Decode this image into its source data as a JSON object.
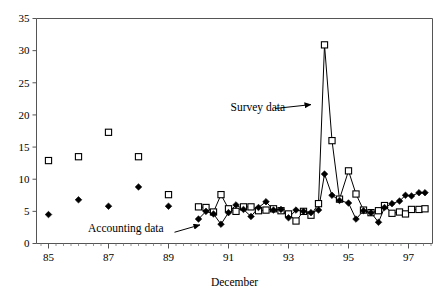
{
  "chart_data": {
    "type": "line",
    "title": "",
    "subtitle": "",
    "xlabel": "December",
    "ylabel": "",
    "xlim": [
      1984.6,
      1997.8
    ],
    "ylim": [
      0,
      35
    ],
    "grid": false,
    "legend_position": "none",
    "x_tick_labels": [
      "85",
      "87",
      "89",
      "91",
      "93",
      "95",
      "97"
    ],
    "x_tick_values": [
      1985,
      1987,
      1989,
      1991,
      1993,
      1995,
      1997
    ],
    "x_minor_tick_step": 0.25,
    "y_tick_labels": [
      "0",
      "5",
      "10",
      "15",
      "20",
      "25",
      "30",
      "35"
    ],
    "y_tick_values": [
      0,
      5,
      10,
      15,
      20,
      25,
      30,
      35
    ],
    "annotations": [
      {
        "name": "survey-data-annotation",
        "text": "Survey data",
        "text_x": 0.49,
        "text_y": 20.6,
        "arrow_from_x": 1992.55,
        "arrow_from_y": 21.0,
        "arrow_to_x": 1993.75,
        "arrow_to_y": 21.6
      },
      {
        "name": "accounting-data-annotation",
        "text": "Accounting data",
        "text_x": 0.13,
        "text_y": 1.85,
        "arrow_from_x": 1989.2,
        "arrow_from_y": 1.75,
        "arrow_to_x": 1990.05,
        "arrow_to_y": 2.9
      }
    ],
    "series": [
      {
        "name": "Survey data",
        "marker": "open-square",
        "color": "#000000",
        "connected_from_x": 1990.0,
        "points": [
          {
            "x": 1985.0,
            "y": 12.9
          },
          {
            "x": 1986.0,
            "y": 13.5
          },
          {
            "x": 1987.0,
            "y": 17.3
          },
          {
            "x": 1988.0,
            "y": 13.5
          },
          {
            "x": 1989.0,
            "y": 7.6
          },
          {
            "x": 1990.0,
            "y": 5.7
          },
          {
            "x": 1990.25,
            "y": 5.6
          },
          {
            "x": 1990.5,
            "y": 4.9
          },
          {
            "x": 1990.75,
            "y": 7.6
          },
          {
            "x": 1991.0,
            "y": 5.4
          },
          {
            "x": 1991.25,
            "y": 5.0
          },
          {
            "x": 1991.5,
            "y": 5.7
          },
          {
            "x": 1991.75,
            "y": 5.7
          },
          {
            "x": 1992.0,
            "y": 5.1
          },
          {
            "x": 1992.25,
            "y": 5.2
          },
          {
            "x": 1992.5,
            "y": 5.4
          },
          {
            "x": 1992.75,
            "y": 5.1
          },
          {
            "x": 1993.0,
            "y": 4.6
          },
          {
            "x": 1993.25,
            "y": 3.5
          },
          {
            "x": 1993.5,
            "y": 5.0
          },
          {
            "x": 1993.75,
            "y": 4.4
          },
          {
            "x": 1994.0,
            "y": 6.2
          },
          {
            "x": 1994.2,
            "y": 30.9
          },
          {
            "x": 1994.45,
            "y": 16.0
          },
          {
            "x": 1994.7,
            "y": 6.9
          },
          {
            "x": 1995.0,
            "y": 11.3
          },
          {
            "x": 1995.25,
            "y": 7.7
          },
          {
            "x": 1995.5,
            "y": 5.2
          },
          {
            "x": 1995.75,
            "y": 4.8
          },
          {
            "x": 1996.0,
            "y": 5.1
          },
          {
            "x": 1996.2,
            "y": 5.9
          },
          {
            "x": 1996.45,
            "y": 4.7
          },
          {
            "x": 1996.7,
            "y": 4.9
          },
          {
            "x": 1996.9,
            "y": 4.6
          },
          {
            "x": 1997.1,
            "y": 5.3
          },
          {
            "x": 1997.35,
            "y": 5.3
          },
          {
            "x": 1997.55,
            "y": 5.4
          }
        ]
      },
      {
        "name": "Accounting data",
        "marker": "filled-diamond",
        "color": "#000000",
        "connected_from_x": 1990.0,
        "points": [
          {
            "x": 1985.0,
            "y": 4.5
          },
          {
            "x": 1986.0,
            "y": 6.8
          },
          {
            "x": 1987.0,
            "y": 5.8
          },
          {
            "x": 1988.0,
            "y": 8.8
          },
          {
            "x": 1989.0,
            "y": 5.8
          },
          {
            "x": 1990.0,
            "y": 3.8
          },
          {
            "x": 1990.25,
            "y": 5.0
          },
          {
            "x": 1990.5,
            "y": 4.6
          },
          {
            "x": 1990.75,
            "y": 3.0
          },
          {
            "x": 1991.0,
            "y": 4.8
          },
          {
            "x": 1991.25,
            "y": 6.0
          },
          {
            "x": 1991.5,
            "y": 5.3
          },
          {
            "x": 1991.75,
            "y": 4.2
          },
          {
            "x": 1992.0,
            "y": 5.6
          },
          {
            "x": 1992.25,
            "y": 6.5
          },
          {
            "x": 1992.5,
            "y": 5.2
          },
          {
            "x": 1992.75,
            "y": 5.3
          },
          {
            "x": 1993.0,
            "y": 4.0
          },
          {
            "x": 1993.25,
            "y": 5.2
          },
          {
            "x": 1993.5,
            "y": 5.0
          },
          {
            "x": 1993.75,
            "y": 4.8
          },
          {
            "x": 1994.0,
            "y": 5.2
          },
          {
            "x": 1994.2,
            "y": 10.8
          },
          {
            "x": 1994.45,
            "y": 7.5
          },
          {
            "x": 1994.7,
            "y": 6.7
          },
          {
            "x": 1995.0,
            "y": 6.3
          },
          {
            "x": 1995.25,
            "y": 3.8
          },
          {
            "x": 1995.5,
            "y": 5.1
          },
          {
            "x": 1995.75,
            "y": 4.8
          },
          {
            "x": 1996.0,
            "y": 3.3
          },
          {
            "x": 1996.2,
            "y": 5.6
          },
          {
            "x": 1996.45,
            "y": 6.2
          },
          {
            "x": 1996.7,
            "y": 6.6
          },
          {
            "x": 1996.9,
            "y": 7.5
          },
          {
            "x": 1997.1,
            "y": 7.4
          },
          {
            "x": 1997.35,
            "y": 7.9
          },
          {
            "x": 1997.55,
            "y": 7.9
          }
        ]
      }
    ]
  }
}
